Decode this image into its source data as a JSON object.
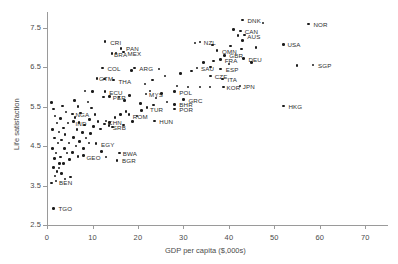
{
  "chart_data": {
    "type": "scatter",
    "title": "",
    "xlabel": "GDP per capita ($,000s)",
    "ylabel": "Life satisfaction",
    "xlim": [
      0,
      75
    ],
    "ylim": [
      2.5,
      7.9
    ],
    "xticks": [
      0,
      10,
      20,
      30,
      40,
      50,
      60,
      70
    ],
    "yticks": [
      2.5,
      3.5,
      4.5,
      5.5,
      6.5,
      7.5
    ],
    "xtick_labels": [
      "0",
      "10",
      "20",
      "30",
      "40",
      "50",
      "60",
      "70"
    ],
    "ytick_labels": [
      "2.5",
      "3.5",
      "4.5",
      "5.5",
      "6.5",
      "7.5"
    ],
    "grid": false,
    "legend": null,
    "point_color": "#1b1b1b",
    "axis_color": "#9a9a9a",
    "points": [
      {
        "label": "DNK",
        "x": 43.0,
        "y": 7.7,
        "lx": 5,
        "ly": -3
      },
      {
        "label": "",
        "x": 47.5,
        "y": 7.62,
        "lx": 0,
        "ly": 0
      },
      {
        "label": "NOR",
        "x": 57.5,
        "y": 7.6,
        "lx": 5,
        "ly": -3
      },
      {
        "label": "",
        "x": 41.0,
        "y": 7.45,
        "lx": 0,
        "ly": 0
      },
      {
        "label": "CAN",
        "x": 42.6,
        "y": 7.42,
        "lx": 4,
        "ly": -3
      },
      {
        "label": "AUS",
        "x": 43.4,
        "y": 7.32,
        "lx": 3,
        "ly": -2
      },
      {
        "label": "",
        "x": 42.0,
        "y": 7.3,
        "lx": 0,
        "ly": 0
      },
      {
        "label": "",
        "x": 43.0,
        "y": 7.18,
        "lx": 0,
        "ly": 0
      },
      {
        "label": "CRI",
        "x": 12.8,
        "y": 7.15,
        "lx": 5,
        "ly": -3
      },
      {
        "label": "NZL",
        "x": 33.6,
        "y": 7.14,
        "lx": 4,
        "ly": -3
      },
      {
        "label": "",
        "x": 32.6,
        "y": 7.12,
        "lx": 0,
        "ly": 0
      },
      {
        "label": "PAN",
        "x": 16.3,
        "y": 6.98,
        "lx": 5,
        "ly": -3
      },
      {
        "label": "MEX",
        "x": 16.8,
        "y": 6.88,
        "lx": 4,
        "ly": -2
      },
      {
        "label": "BRA",
        "x": 14.3,
        "y": 6.85,
        "lx": 2,
        "ly": -2
      },
      {
        "label": "",
        "x": 15.2,
        "y": 6.86,
        "lx": 0,
        "ly": 0
      },
      {
        "label": "OMN",
        "x": 37.4,
        "y": 6.92,
        "lx": 5,
        "ly": -3
      },
      {
        "label": "",
        "x": 42.8,
        "y": 6.96,
        "lx": 0,
        "ly": 0
      },
      {
        "label": "GBR",
        "x": 39.0,
        "y": 6.8,
        "lx": 5,
        "ly": -3
      },
      {
        "label": "FRA",
        "x": 38.2,
        "y": 6.7,
        "lx": 4,
        "ly": -2
      },
      {
        "label": "DEU",
        "x": 43.2,
        "y": 6.72,
        "lx": 5,
        "ly": -3
      },
      {
        "label": "USA",
        "x": 52.0,
        "y": 7.08,
        "lx": 4,
        "ly": -3
      },
      {
        "label": "LUX",
        "x": 87.0,
        "y": 6.94,
        "lx": 5,
        "ly": -3
      },
      {
        "label": "QAT",
        "x": 94.0,
        "y": 6.6,
        "lx": 5,
        "ly": -3
      },
      {
        "label": "SGP",
        "x": 58.5,
        "y": 6.56,
        "lx": 5,
        "ly": -3
      },
      {
        "label": "",
        "x": 55.0,
        "y": 6.54,
        "lx": 0,
        "ly": 0
      },
      {
        "label": "COL",
        "x": 12.2,
        "y": 6.48,
        "lx": 5,
        "ly": -3
      },
      {
        "label": "ARG",
        "x": 19.2,
        "y": 6.48,
        "lx": 5,
        "ly": -3
      },
      {
        "label": "",
        "x": 18.6,
        "y": 6.42,
        "lx": 0,
        "ly": 0
      },
      {
        "label": "SAU",
        "x": 33.0,
        "y": 6.48,
        "lx": 4,
        "ly": -3
      },
      {
        "label": "ESP",
        "x": 38.2,
        "y": 6.46,
        "lx": 5,
        "ly": -3
      },
      {
        "label": "",
        "x": 36.0,
        "y": 6.5,
        "lx": 0,
        "ly": 0
      },
      {
        "label": "",
        "x": 24.6,
        "y": 6.46,
        "lx": 0,
        "ly": 0
      },
      {
        "label": "CZE",
        "x": 36.0,
        "y": 6.28,
        "lx": 4,
        "ly": -3
      },
      {
        "label": "ITA",
        "x": 38.6,
        "y": 6.2,
        "lx": 5,
        "ly": -3
      },
      {
        "label": "THA",
        "x": 14.6,
        "y": 6.18,
        "lx": 5,
        "ly": -2
      },
      {
        "label": "GTM",
        "x": 11.0,
        "y": 6.22,
        "lx": 2,
        "ly": -3
      },
      {
        "label": "",
        "x": 12.6,
        "y": 6.2,
        "lx": 0,
        "ly": 0
      },
      {
        "label": "KOR",
        "x": 38.8,
        "y": 6.0,
        "lx": 3,
        "ly": -3
      },
      {
        "label": "JPN",
        "x": 42.4,
        "y": 6.02,
        "lx": 3,
        "ly": -3
      },
      {
        "label": "",
        "x": 31.0,
        "y": 6.0,
        "lx": 0,
        "ly": 0
      },
      {
        "label": "",
        "x": 33.6,
        "y": 6.0,
        "lx": 0,
        "ly": 0
      },
      {
        "label": "",
        "x": 35.8,
        "y": 6.0,
        "lx": 0,
        "ly": 0
      },
      {
        "label": "",
        "x": 28.6,
        "y": 6.02,
        "lx": 0,
        "ly": 0
      },
      {
        "label": "POL",
        "x": 28.0,
        "y": 5.88,
        "lx": 5,
        "ly": -3
      },
      {
        "label": "ECU",
        "x": 12.8,
        "y": 5.88,
        "lx": 4,
        "ly": -3
      },
      {
        "label": "",
        "x": 10.0,
        "y": 5.88,
        "lx": 0,
        "ly": 0
      },
      {
        "label": "",
        "x": 8.4,
        "y": 5.9,
        "lx": 0,
        "ly": 0
      },
      {
        "label": "MYS",
        "x": 21.8,
        "y": 5.82,
        "lx": 3,
        "ly": -3
      },
      {
        "label": "PER",
        "x": 13.8,
        "y": 5.76,
        "lx": 3,
        "ly": -2
      },
      {
        "label": "",
        "x": 12.4,
        "y": 5.74,
        "lx": 0,
        "ly": 0
      },
      {
        "label": "GRC",
        "x": 30.0,
        "y": 5.68,
        "lx": 5,
        "ly": -3
      },
      {
        "label": "BHR",
        "x": 28.0,
        "y": 5.56,
        "lx": 5,
        "ly": -3
      },
      {
        "label": "POR",
        "x": 28.0,
        "y": 5.44,
        "lx": 5,
        "ly": -3
      },
      {
        "label": "TUR",
        "x": 22.0,
        "y": 5.48,
        "lx": 3,
        "ly": -2
      },
      {
        "label": "",
        "x": 23.4,
        "y": 5.54,
        "lx": 0,
        "ly": 0
      },
      {
        "label": "",
        "x": 20.6,
        "y": 5.58,
        "lx": 0,
        "ly": 0
      },
      {
        "label": "ROM",
        "x": 18.0,
        "y": 5.3,
        "lx": 4,
        "ly": -2
      },
      {
        "label": "NGA",
        "x": 5.6,
        "y": 5.32,
        "lx": 3,
        "ly": -3
      },
      {
        "label": "IND",
        "x": 5.8,
        "y": 5.12,
        "lx": 2,
        "ly": -2
      },
      {
        "label": "CHN",
        "x": 13.0,
        "y": 5.14,
        "lx": 2,
        "ly": -2
      },
      {
        "label": "HUN",
        "x": 23.6,
        "y": 5.14,
        "lx": 5,
        "ly": -3
      },
      {
        "label": "SRB",
        "x": 13.6,
        "y": 5.02,
        "lx": 4,
        "ly": -2
      },
      {
        "label": "EGY",
        "x": 10.8,
        "y": 4.56,
        "lx": 5,
        "ly": -3
      },
      {
        "label": "GEO",
        "x": 8.0,
        "y": 4.26,
        "lx": 3,
        "ly": -2
      },
      {
        "label": "BWA",
        "x": 16.0,
        "y": 4.32,
        "lx": 3,
        "ly": -3
      },
      {
        "label": "BGR",
        "x": 15.4,
        "y": 4.14,
        "lx": 5,
        "ly": -3
      },
      {
        "label": "BEN",
        "x": 2.0,
        "y": 3.62,
        "lx": 3,
        "ly": -2
      },
      {
        "label": "TGO",
        "x": 1.4,
        "y": 2.92,
        "lx": 5,
        "ly": -3
      },
      {
        "label": "",
        "x": 1.0,
        "y": 5.6,
        "lx": 0,
        "ly": 0
      },
      {
        "label": "",
        "x": 1.4,
        "y": 5.44,
        "lx": 0,
        "ly": 0
      },
      {
        "label": "",
        "x": 1.8,
        "y": 5.26,
        "lx": 0,
        "ly": 0
      },
      {
        "label": "",
        "x": 2.2,
        "y": 5.08,
        "lx": 0,
        "ly": 0
      },
      {
        "label": "",
        "x": 1.2,
        "y": 4.92,
        "lx": 0,
        "ly": 0
      },
      {
        "label": "",
        "x": 2.6,
        "y": 4.86,
        "lx": 0,
        "ly": 0
      },
      {
        "label": "",
        "x": 1.6,
        "y": 4.7,
        "lx": 0,
        "ly": 0
      },
      {
        "label": "",
        "x": 2.4,
        "y": 4.58,
        "lx": 0,
        "ly": 0
      },
      {
        "label": "",
        "x": 1.2,
        "y": 4.44,
        "lx": 0,
        "ly": 0
      },
      {
        "label": "",
        "x": 2.0,
        "y": 4.32,
        "lx": 0,
        "ly": 0
      },
      {
        "label": "",
        "x": 1.6,
        "y": 4.18,
        "lx": 0,
        "ly": 0
      },
      {
        "label": "",
        "x": 2.8,
        "y": 4.06,
        "lx": 0,
        "ly": 0
      },
      {
        "label": "",
        "x": 1.4,
        "y": 3.96,
        "lx": 0,
        "ly": 0
      },
      {
        "label": "",
        "x": 2.2,
        "y": 3.86,
        "lx": 0,
        "ly": 0
      },
      {
        "label": "",
        "x": 1.8,
        "y": 3.74,
        "lx": 0,
        "ly": 0
      },
      {
        "label": "",
        "x": 1.0,
        "y": 3.56,
        "lx": 0,
        "ly": 0
      },
      {
        "label": "",
        "x": 3.4,
        "y": 5.52,
        "lx": 0,
        "ly": 0
      },
      {
        "label": "",
        "x": 4.2,
        "y": 5.36,
        "lx": 0,
        "ly": 0
      },
      {
        "label": "",
        "x": 3.0,
        "y": 5.2,
        "lx": 0,
        "ly": 0
      },
      {
        "label": "",
        "x": 4.6,
        "y": 5.08,
        "lx": 0,
        "ly": 0
      },
      {
        "label": "",
        "x": 3.6,
        "y": 4.96,
        "lx": 0,
        "ly": 0
      },
      {
        "label": "",
        "x": 4.0,
        "y": 4.8,
        "lx": 0,
        "ly": 0
      },
      {
        "label": "",
        "x": 3.2,
        "y": 4.66,
        "lx": 0,
        "ly": 0
      },
      {
        "label": "",
        "x": 4.8,
        "y": 4.58,
        "lx": 0,
        "ly": 0
      },
      {
        "label": "",
        "x": 3.8,
        "y": 4.44,
        "lx": 0,
        "ly": 0
      },
      {
        "label": "",
        "x": 4.4,
        "y": 4.32,
        "lx": 0,
        "ly": 0
      },
      {
        "label": "",
        "x": 3.0,
        "y": 4.22,
        "lx": 0,
        "ly": 0
      },
      {
        "label": "",
        "x": 5.0,
        "y": 4.16,
        "lx": 0,
        "ly": 0
      },
      {
        "label": "",
        "x": 3.6,
        "y": 4.06,
        "lx": 0,
        "ly": 0
      },
      {
        "label": "",
        "x": 2.6,
        "y": 3.94,
        "lx": 0,
        "ly": 0
      },
      {
        "label": "",
        "x": 3.2,
        "y": 3.8,
        "lx": 0,
        "ly": 0
      },
      {
        "label": "",
        "x": 6.0,
        "y": 5.66,
        "lx": 0,
        "ly": 0
      },
      {
        "label": "",
        "x": 6.8,
        "y": 5.5,
        "lx": 0,
        "ly": 0
      },
      {
        "label": "",
        "x": 7.4,
        "y": 5.34,
        "lx": 0,
        "ly": 0
      },
      {
        "label": "",
        "x": 6.2,
        "y": 5.22,
        "lx": 0,
        "ly": 0
      },
      {
        "label": "",
        "x": 7.0,
        "y": 5.1,
        "lx": 0,
        "ly": 0
      },
      {
        "label": "",
        "x": 8.2,
        "y": 5.04,
        "lx": 0,
        "ly": 0
      },
      {
        "label": "",
        "x": 6.6,
        "y": 4.92,
        "lx": 0,
        "ly": 0
      },
      {
        "label": "",
        "x": 7.8,
        "y": 4.84,
        "lx": 0,
        "ly": 0
      },
      {
        "label": "",
        "x": 5.8,
        "y": 4.72,
        "lx": 0,
        "ly": 0
      },
      {
        "label": "",
        "x": 7.2,
        "y": 4.62,
        "lx": 0,
        "ly": 0
      },
      {
        "label": "",
        "x": 6.4,
        "y": 4.5,
        "lx": 0,
        "ly": 0
      },
      {
        "label": "",
        "x": 8.0,
        "y": 4.44,
        "lx": 0,
        "ly": 0
      },
      {
        "label": "",
        "x": 5.6,
        "y": 4.34,
        "lx": 0,
        "ly": 0
      },
      {
        "label": "",
        "x": 6.8,
        "y": 4.24,
        "lx": 0,
        "ly": 0
      },
      {
        "label": "",
        "x": 9.0,
        "y": 5.62,
        "lx": 0,
        "ly": 0
      },
      {
        "label": "",
        "x": 9.8,
        "y": 5.46,
        "lx": 0,
        "ly": 0
      },
      {
        "label": "",
        "x": 10.6,
        "y": 5.3,
        "lx": 0,
        "ly": 0
      },
      {
        "label": "",
        "x": 9.4,
        "y": 5.18,
        "lx": 0,
        "ly": 0
      },
      {
        "label": "",
        "x": 11.2,
        "y": 5.12,
        "lx": 0,
        "ly": 0
      },
      {
        "label": "",
        "x": 10.2,
        "y": 5.0,
        "lx": 0,
        "ly": 0
      },
      {
        "label": "",
        "x": 11.8,
        "y": 4.94,
        "lx": 0,
        "ly": 0
      },
      {
        "label": "",
        "x": 9.6,
        "y": 4.82,
        "lx": 0,
        "ly": 0
      },
      {
        "label": "",
        "x": 12.6,
        "y": 5.06,
        "lx": 0,
        "ly": 0
      },
      {
        "label": "",
        "x": 13.8,
        "y": 5.1,
        "lx": 0,
        "ly": 0
      },
      {
        "label": "",
        "x": 15.0,
        "y": 5.22,
        "lx": 0,
        "ly": 0
      },
      {
        "label": "",
        "x": 16.2,
        "y": 5.3,
        "lx": 0,
        "ly": 0
      },
      {
        "label": "",
        "x": 17.4,
        "y": 5.38,
        "lx": 0,
        "ly": 0
      },
      {
        "label": "",
        "x": 14.4,
        "y": 4.98,
        "lx": 0,
        "ly": 0
      },
      {
        "label": "",
        "x": 16.8,
        "y": 5.04,
        "lx": 0,
        "ly": 0
      },
      {
        "label": "",
        "x": 18.8,
        "y": 5.12,
        "lx": 0,
        "ly": 0
      },
      {
        "label": "",
        "x": 19.8,
        "y": 5.26,
        "lx": 0,
        "ly": 0
      },
      {
        "label": "",
        "x": 20.8,
        "y": 5.4,
        "lx": 0,
        "ly": 0
      },
      {
        "label": "",
        "x": 24.0,
        "y": 5.72,
        "lx": 0,
        "ly": 0
      },
      {
        "label": "",
        "x": 25.2,
        "y": 5.84,
        "lx": 0,
        "ly": 0
      },
      {
        "label": "",
        "x": 26.4,
        "y": 5.62,
        "lx": 0,
        "ly": 0
      },
      {
        "label": "",
        "x": 22.6,
        "y": 5.9,
        "lx": 0,
        "ly": 0
      },
      {
        "label": "",
        "x": 17.0,
        "y": 5.66,
        "lx": 0,
        "ly": 0
      },
      {
        "label": "",
        "x": 18.2,
        "y": 5.78,
        "lx": 0,
        "ly": 0
      },
      {
        "label": "",
        "x": 15.8,
        "y": 5.74,
        "lx": 0,
        "ly": 0
      },
      {
        "label": "",
        "x": 21.6,
        "y": 6.08,
        "lx": 0,
        "ly": 0
      },
      {
        "label": "",
        "x": 23.2,
        "y": 6.18,
        "lx": 0,
        "ly": 0
      },
      {
        "label": "",
        "x": 26.0,
        "y": 6.28,
        "lx": 0,
        "ly": 0
      },
      {
        "label": "",
        "x": 29.4,
        "y": 6.34,
        "lx": 0,
        "ly": 0
      },
      {
        "label": "",
        "x": 31.8,
        "y": 6.4,
        "lx": 0,
        "ly": 0
      },
      {
        "label": "",
        "x": 34.4,
        "y": 6.62,
        "lx": 0,
        "ly": 0
      },
      {
        "label": "",
        "x": 36.6,
        "y": 6.66,
        "lx": 0,
        "ly": 0
      },
      {
        "label": "",
        "x": 40.0,
        "y": 6.58,
        "lx": 0,
        "ly": 0
      },
      {
        "label": "",
        "x": 45.0,
        "y": 6.62,
        "lx": 0,
        "ly": 0
      },
      {
        "label": "",
        "x": 46.0,
        "y": 7.0,
        "lx": 0,
        "ly": 0
      },
      {
        "label": "",
        "x": 40.4,
        "y": 7.04,
        "lx": 0,
        "ly": 0
      },
      {
        "label": "",
        "x": 36.4,
        "y": 7.06,
        "lx": 0,
        "ly": 0
      },
      {
        "label": "HKG",
        "x": 52.0,
        "y": 5.52,
        "lx": 5,
        "ly": -3
      },
      {
        "label": "",
        "x": 12.0,
        "y": 4.36,
        "lx": 0,
        "ly": 0
      },
      {
        "label": "",
        "x": 13.0,
        "y": 4.22,
        "lx": 0,
        "ly": 0
      },
      {
        "label": "",
        "x": 8.6,
        "y": 4.7,
        "lx": 0,
        "ly": 0
      },
      {
        "label": "",
        "x": 9.2,
        "y": 4.58,
        "lx": 0,
        "ly": 0
      },
      {
        "label": "",
        "x": 5.2,
        "y": 3.72,
        "lx": 0,
        "ly": 0
      },
      {
        "label": "",
        "x": 4.0,
        "y": 3.66,
        "lx": 0,
        "ly": 0
      }
    ]
  },
  "axis": {
    "x_title": "GDP per capita ($,000s)",
    "y_title": "Life satisfaction"
  }
}
